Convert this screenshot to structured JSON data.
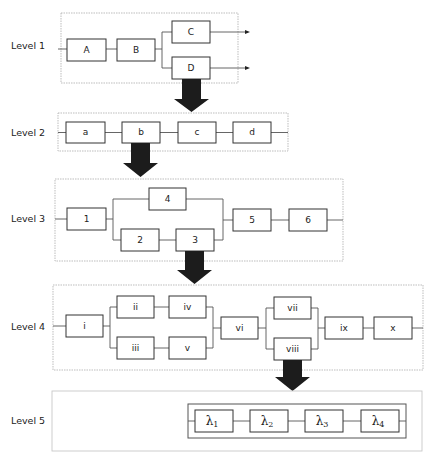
{
  "diagram": {
    "type": "hierarchical reliability block diagram",
    "levels": [
      {
        "label": "Level 1",
        "frame": [
          61,
          13,
          177,
          70
        ],
        "blocks": [
          {
            "id": "A",
            "label": "A",
            "x": 67,
            "y": 39,
            "w": 39,
            "h": 22
          },
          {
            "id": "B",
            "label": "B",
            "x": 117,
            "y": 39,
            "w": 38,
            "h": 22
          },
          {
            "id": "C",
            "label": "C",
            "x": 172,
            "y": 21,
            "w": 38,
            "h": 22
          },
          {
            "id": "D",
            "label": "D",
            "x": 172,
            "y": 57,
            "w": 38,
            "h": 22
          }
        ],
        "outputs": [
          "C",
          "D"
        ],
        "expands": "D"
      },
      {
        "label": "Level 2",
        "frame": [
          58,
          113,
          230,
          38
        ],
        "blocks": [
          {
            "id": "a",
            "label": "a",
            "x": 66,
            "y": 122,
            "w": 39,
            "h": 21
          },
          {
            "id": "b",
            "label": "b",
            "x": 122,
            "y": 122,
            "w": 38,
            "h": 21
          },
          {
            "id": "c",
            "label": "c",
            "x": 178,
            "y": 122,
            "w": 38,
            "h": 21
          },
          {
            "id": "d",
            "label": "d",
            "x": 233,
            "y": 122,
            "w": 38,
            "h": 21
          }
        ],
        "expands": "b"
      },
      {
        "label": "Level 3",
        "frame": [
          55,
          179,
          288,
          82
        ],
        "blocks": [
          {
            "id": "1",
            "label": "1",
            "x": 67,
            "y": 208,
            "w": 39,
            "h": 22
          },
          {
            "id": "4",
            "label": "4",
            "x": 149,
            "y": 188,
            "w": 37,
            "h": 22
          },
          {
            "id": "2",
            "label": "2",
            "x": 121,
            "y": 229,
            "w": 38,
            "h": 22
          },
          {
            "id": "3",
            "label": "3",
            "x": 176,
            "y": 229,
            "w": 38,
            "h": 22
          },
          {
            "id": "5",
            "label": "5",
            "x": 233,
            "y": 209,
            "w": 38,
            "h": 22
          },
          {
            "id": "6",
            "label": "6",
            "x": 289,
            "y": 209,
            "w": 38,
            "h": 22
          }
        ],
        "expands": "3"
      },
      {
        "label": "Level 4",
        "frame": [
          53,
          285,
          370,
          85
        ],
        "blocks": [
          {
            "id": "i",
            "label": "i",
            "x": 66,
            "y": 315,
            "w": 37,
            "h": 22
          },
          {
            "id": "ii",
            "label": "ii",
            "x": 117,
            "y": 296,
            "w": 37,
            "h": 22
          },
          {
            "id": "iv",
            "label": "iv",
            "x": 169,
            "y": 296,
            "w": 37,
            "h": 22
          },
          {
            "id": "iii",
            "label": "iii",
            "x": 117,
            "y": 337,
            "w": 37,
            "h": 22
          },
          {
            "id": "v",
            "label": "v",
            "x": 169,
            "y": 337,
            "w": 37,
            "h": 22
          },
          {
            "id": "vi",
            "label": "vi",
            "x": 221,
            "y": 317,
            "w": 37,
            "h": 22
          },
          {
            "id": "vii",
            "label": "vii",
            "x": 274,
            "y": 297,
            "w": 37,
            "h": 22
          },
          {
            "id": "viii",
            "label": "viii",
            "x": 274,
            "y": 338,
            "w": 37,
            "h": 22
          },
          {
            "id": "ix",
            "label": "ix",
            "x": 325,
            "y": 317,
            "w": 38,
            "h": 22
          },
          {
            "id": "x",
            "label": "x",
            "x": 374,
            "y": 317,
            "w": 38,
            "h": 22
          }
        ],
        "expands": "viii"
      },
      {
        "label": "Level 5",
        "frame": [
          52,
          391,
          370,
          60
        ],
        "inner_frame": [
          188,
          404,
          218,
          34
        ],
        "blocks": [
          {
            "id": "l1",
            "label": "λ",
            "sub": "1",
            "x": 195,
            "y": 410,
            "w": 38,
            "h": 22
          },
          {
            "id": "l2",
            "label": "λ",
            "sub": "2",
            "x": 250,
            "y": 410,
            "w": 38,
            "h": 22
          },
          {
            "id": "l3",
            "label": "λ",
            "sub": "3",
            "x": 305,
            "y": 410,
            "w": 38,
            "h": 22
          },
          {
            "id": "l4",
            "label": "λ",
            "sub": "4",
            "x": 361,
            "y": 410,
            "w": 38,
            "h": 22
          }
        ]
      }
    ],
    "labels": {
      "level1": "Level 1",
      "level2": "Level 2",
      "level3": "Level 3",
      "level4": "Level 4",
      "level5": "Level 5"
    },
    "colors": {
      "arrow": "#1c1c1c",
      "frame": "#b5b5b5",
      "block_stroke": "#333333",
      "background": "#ffffff"
    }
  }
}
